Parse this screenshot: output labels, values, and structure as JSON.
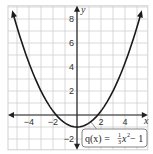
{
  "chart_data": {
    "type": "line",
    "title": "",
    "xlabel": "x",
    "ylabel": "y",
    "xlim": [
      -5.75,
      5.9
    ],
    "ylim": [
      -2.9,
      9.1
    ],
    "grid": true,
    "x_ticks": [
      -4,
      -2,
      2,
      4
    ],
    "y_ticks": [
      8,
      6,
      4,
      2,
      -2
    ],
    "x_tick_labels": [
      "−4",
      "−2",
      "2",
      "4"
    ],
    "y_tick_labels": [
      "8",
      "6",
      "4",
      "2",
      "−2"
    ],
    "series": [
      {
        "name": "q(x) = (1/3)x² − 1",
        "function": "x^2/3 - 1",
        "x": [
          -5.25,
          -4,
          -3,
          -2,
          -1,
          0,
          1,
          2,
          3,
          4,
          5.25
        ],
        "values": [
          8.19,
          4.33,
          2,
          0.33,
          -0.67,
          -1,
          -0.67,
          0.33,
          2,
          4.33,
          8.19
        ]
      }
    ],
    "annotations": [
      {
        "text": "q(x) = 1/3 x² − 1",
        "points_to": [
          1.2,
          -0.52
        ]
      }
    ]
  },
  "labels": {
    "x_axis": "x",
    "y_axis": "y",
    "eq_prefix": "q(x) = ",
    "eq_num": "1",
    "eq_den": "3",
    "eq_var": "x",
    "eq_exp": "2",
    "eq_suffix": " − 1"
  },
  "colors": {
    "grid": "#cfcfcf",
    "axis": "#222222",
    "curve": "#1a1a1a"
  }
}
